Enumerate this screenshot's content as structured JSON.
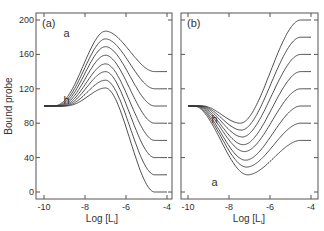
{
  "figure": {
    "ylabel": "Bound probe",
    "xlabel": "Log [L",
    "xlabel_sub": "t",
    "xlabel_close": "]"
  },
  "chart_data": [
    {
      "type": "line",
      "panel_label": "(a)",
      "title": "",
      "xlabel": "Log [Lt]",
      "ylabel": "Bound probe",
      "xlim": [
        -10.2,
        -3.8
      ],
      "ylim": [
        -5,
        205
      ],
      "xticks": [
        -10,
        -8,
        -6,
        -4
      ],
      "yticks": [
        0,
        40,
        80,
        120,
        160,
        200
      ],
      "grid": false,
      "curve_labels": [
        {
          "text": "a",
          "x": -8.9,
          "y": 185
        },
        {
          "text": "h",
          "x": -8.9,
          "y": 107
        }
      ],
      "series": [
        {
          "name": "a",
          "start": 100,
          "peak": 187,
          "peak_x": -7.0,
          "end": 140
        },
        {
          "name": "b",
          "start": 100,
          "peak": 178,
          "peak_x": -7.0,
          "end": 120
        },
        {
          "name": "c",
          "start": 100,
          "peak": 169,
          "peak_x": -7.0,
          "end": 100
        },
        {
          "name": "d",
          "start": 100,
          "peak": 159,
          "peak_x": -7.0,
          "end": 80
        },
        {
          "name": "e",
          "start": 100,
          "peak": 149,
          "peak_x": -7.0,
          "end": 60
        },
        {
          "name": "f",
          "start": 100,
          "peak": 140,
          "peak_x": -7.0,
          "end": 40
        },
        {
          "name": "g",
          "start": 100,
          "peak": 130,
          "peak_x": -7.0,
          "end": 20
        },
        {
          "name": "h",
          "start": 100,
          "peak": 121,
          "peak_x": -7.0,
          "end": 0
        }
      ]
    },
    {
      "type": "line",
      "panel_label": "(b)",
      "title": "",
      "xlabel": "Log [Lt]",
      "ylabel": "",
      "xlim": [
        -10.2,
        -3.8
      ],
      "ylim": [
        -5,
        205
      ],
      "xticks": [
        -10,
        -8,
        -6,
        -4
      ],
      "yticks": [
        0,
        40,
        80,
        120,
        160,
        200
      ],
      "grid": false,
      "curve_labels": [
        {
          "text": "h",
          "x": -8.7,
          "y": 85
        },
        {
          "text": "a",
          "x": -8.7,
          "y": 12
        }
      ],
      "series": [
        {
          "name": "a",
          "start": 100,
          "trough": 20,
          "trough_x": -7.1,
          "end": 60
        },
        {
          "name": "b",
          "start": 100,
          "trough": 29,
          "trough_x": -7.15,
          "end": 80
        },
        {
          "name": "c",
          "start": 100,
          "trough": 37,
          "trough_x": -7.2,
          "end": 100
        },
        {
          "name": "d",
          "start": 100,
          "trough": 47,
          "trough_x": -7.25,
          "end": 120
        },
        {
          "name": "e",
          "start": 100,
          "trough": 55,
          "trough_x": -7.3,
          "end": 140
        },
        {
          "name": "f",
          "start": 100,
          "trough": 64,
          "trough_x": -7.35,
          "end": 160
        },
        {
          "name": "g",
          "start": 100,
          "trough": 72,
          "trough_x": -7.4,
          "end": 180
        },
        {
          "name": "h",
          "start": 100,
          "trough": 80,
          "trough_x": -7.45,
          "end": 200
        }
      ]
    }
  ],
  "colors": {
    "line": "#3a3a3a",
    "axis": "#555555",
    "text": "#333333"
  }
}
